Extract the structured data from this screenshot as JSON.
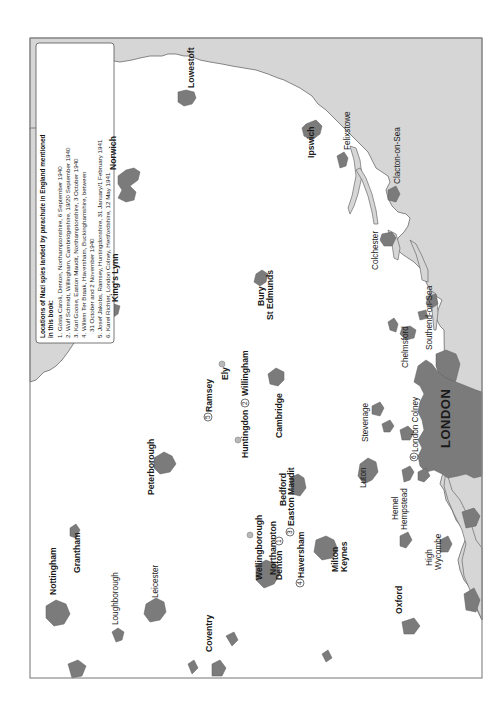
{
  "map": {
    "orientation": "rotated 90 degrees counter-clockwise",
    "colors": {
      "sea": "#d6d6d6",
      "urban": "#7b7b7b",
      "land": "#ffffff",
      "frame": "#8a8a8a"
    },
    "legend": {
      "title_line1": "Locations of Nazi spies landed by parachute in England mentioned",
      "title_line2": "in this book:",
      "items": [
        "1. Gösta Caroli, Denton, Northamptonshire, 6 September 1940",
        "2. Wulf Schmidt, Willingham, Cambridgeshire, 19/20 September 1940",
        "3. Karl Goose, Easton Maudit, Northamptonshire, 3 October 1940",
        "4. Willem Ter Braak, Haversham, Buckinghamshire, between",
        "    31 October and 2 November 1940",
        "5. Josef Jakobs, Ramsey, Huntingdonshire, 31 January/1 February 1941",
        "6. Karel Richter, London Colney, Hertfordshire, 12 May 1941"
      ]
    },
    "towns": {
      "lowestoft": "Lowestoft",
      "norwich": "Norwich",
      "kings_lynn": "King's Lynn",
      "felixstowe": "Felixstowe",
      "clacton": "Clacton-on-Sea",
      "ipswich": "Ipswich",
      "colchester": "Colchester",
      "southend": "Southend-on-Sea",
      "bury1": "Bury",
      "bury2": "St Edmunds",
      "ely": "Ely",
      "willingham": "Willingham",
      "ramsey": "Ramsey",
      "huntingdon": "Huntingdon",
      "cambridge": "Cambridge",
      "chelmsford": "Chelmsford",
      "stevenage": "Stevenage",
      "london_colney": "London Colney",
      "london": "LONDON",
      "peterborough": "Peterborough",
      "bedford": "Bedford",
      "easton_maudit": "Easton Maudit",
      "luton": "Luton",
      "hemel1": "Hemel",
      "hemel2": "Hempstead",
      "wellingborough": "Wellingborough",
      "northampton": "Northampton",
      "denton": "Denton",
      "haversham": "Haversham",
      "milton1": "Milton",
      "milton2": "Keynes",
      "high1": "High",
      "high2": "Wycombe",
      "grantham": "Grantham",
      "nottingham": "Nottingham",
      "loughborough": "Loughborough",
      "leicester": "Leicester",
      "coventry": "Coventry",
      "oxford": "Oxford"
    },
    "markers": {
      "m1": "1",
      "m2": "2",
      "m3": "3",
      "m4": "4",
      "m5": "5",
      "m6": "6"
    }
  }
}
